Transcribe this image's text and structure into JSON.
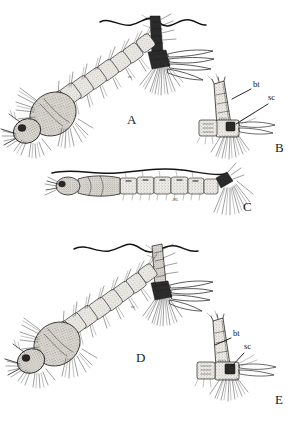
{
  "plate": {
    "title": "Mosquito larvae comparative plate",
    "background_color": "#ffffff",
    "ink_color": "#1b1b1b",
    "segment_fill_color": "#e9e7e2",
    "dark_accent_color": "#2b2b2b",
    "width": 292,
    "height": 433
  },
  "panels": [
    {
      "id": "A",
      "letter": "A",
      "subject": "whole larva hanging at water surface, oblique view",
      "letter_x": 127,
      "letter_y": 124
    },
    {
      "id": "B",
      "letter": "B",
      "subject": "siphon and anal segment detail",
      "letter_x": 275,
      "letter_y": 152
    },
    {
      "id": "C",
      "letter": "C",
      "subject": "whole larva lying parallel to water surface, lateral view",
      "letter_x": 243,
      "letter_y": 211
    },
    {
      "id": "D",
      "letter": "D",
      "subject": "whole larva hanging at water surface, oblique view",
      "letter_x": 136,
      "letter_y": 362
    },
    {
      "id": "E",
      "letter": "E",
      "subject": "siphon and anal segment detail",
      "letter_x": 275,
      "letter_y": 404
    }
  ],
  "annotations": {
    "bt": "bt",
    "sc": "sc",
    "signature": "JRL"
  },
  "label_positions": {
    "b_bt": {
      "x": 253,
      "y": 87
    },
    "b_sc": {
      "x": 268,
      "y": 100
    },
    "e_bt": {
      "x": 233,
      "y": 336
    },
    "e_sc": {
      "x": 244,
      "y": 349
    },
    "signature": {
      "x": 172,
      "y": 201
    }
  }
}
